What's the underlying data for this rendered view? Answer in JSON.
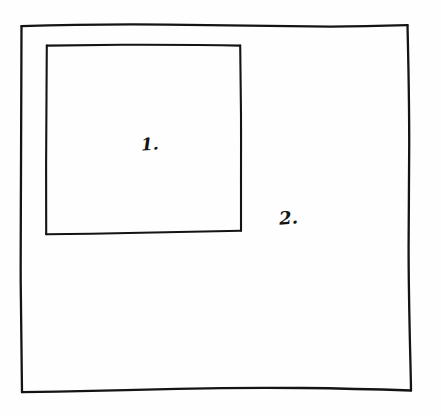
{
  "diagram": {
    "medium": "hand-drawn ink on white paper",
    "background_color": "#fefefe",
    "ink_color": "#141414",
    "shapes": [
      {
        "id": "inner-rectangle",
        "name": "inner rectangle",
        "label": "1.",
        "label_x": 141,
        "label_y": 136,
        "x": 46,
        "y": 44,
        "width": 195,
        "height": 189,
        "stroke_width": 2.1,
        "nesting": "inside outer rectangle"
      },
      {
        "id": "outer-rectangle",
        "name": "outer rectangle",
        "label": "2.",
        "label_x": 279,
        "label_y": 209,
        "x": 21,
        "y": 25,
        "width": 388,
        "height": 367,
        "stroke_width": 2.3,
        "nesting": "outermost frame"
      }
    ],
    "labels": {
      "one": "1.",
      "two": "2."
    }
  }
}
